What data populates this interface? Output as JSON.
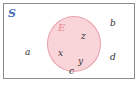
{
  "diagram": {
    "type": "venn-set-diagram",
    "universe": {
      "label": "S",
      "color": "#4a72b8",
      "shape": "rectangle",
      "border_color": "#8b8b8b"
    },
    "subset": {
      "label": "E",
      "color": "#e88a94",
      "shape": "circle",
      "fill_color": "#f9d4d8",
      "border_color": "#e8a0ab"
    },
    "inside_elements": [
      {
        "label": "z"
      },
      {
        "label": "x"
      },
      {
        "label": "y"
      }
    ],
    "outside_elements": [
      {
        "label": "a"
      },
      {
        "label": "b"
      },
      {
        "label": "c"
      },
      {
        "label": "d"
      }
    ]
  }
}
